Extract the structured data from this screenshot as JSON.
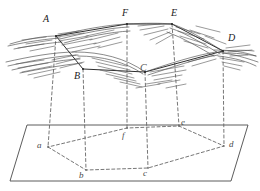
{
  "figure": {
    "type": "geometric-projection-diagram",
    "colors": {
      "stroke": "#3a3a3a",
      "hatch": "#555555",
      "dashed": "#666666",
      "plane": "#4a4a4a",
      "background": "#ffffff"
    },
    "upper_surface": {
      "name": "folded-surface",
      "points": [
        {
          "id": "A",
          "label": "A",
          "x": 56,
          "y": 36,
          "label_x": 43,
          "label_y": 14
        },
        {
          "id": "B",
          "label": "B",
          "x": 83,
          "y": 69,
          "label_x": 74,
          "label_y": 71
        },
        {
          "id": "C",
          "label": "C",
          "x": 145,
          "y": 72,
          "label_x": 140,
          "label_y": 63
        },
        {
          "id": "D",
          "label": "D",
          "x": 223,
          "y": 51,
          "label_x": 228,
          "label_y": 33
        },
        {
          "id": "E",
          "label": "E",
          "x": 172,
          "y": 24,
          "label_x": 171,
          "label_y": 8
        },
        {
          "id": "F",
          "label": "F",
          "x": 127,
          "y": 24,
          "label_x": 122,
          "label_y": 8
        }
      ]
    },
    "ground_plane": {
      "name": "horizontal-plane",
      "corners": [
        {
          "x": 27,
          "y": 125
        },
        {
          "x": 248,
          "y": 125
        },
        {
          "x": 231,
          "y": 181
        },
        {
          "x": 10,
          "y": 181
        }
      ],
      "points": [
        {
          "id": "a",
          "label": "a",
          "x": 48,
          "y": 147,
          "label_x": 40,
          "label_y": 142
        },
        {
          "id": "b",
          "label": "b",
          "x": 86,
          "y": 170,
          "label_x": 79,
          "label_y": 172
        },
        {
          "id": "c",
          "label": "c",
          "x": 148,
          "y": 168,
          "label_x": 143,
          "label_y": 170
        },
        {
          "id": "d",
          "label": "d",
          "x": 224,
          "y": 146,
          "label_x": 228,
          "label_y": 141
        },
        {
          "id": "e",
          "label": "e",
          "x": 179,
          "y": 126,
          "label_x": 181,
          "label_y": 120
        },
        {
          "id": "f",
          "label": "f",
          "x": 127,
          "y": 128,
          "label_x": 122,
          "label_y": 133
        }
      ],
      "polygon_order": [
        "a",
        "b",
        "c",
        "d",
        "e",
        "f"
      ]
    },
    "projection_lines": [
      {
        "from": "A",
        "to": "a"
      },
      {
        "from": "B",
        "to": "b"
      },
      {
        "from": "C",
        "to": "c"
      },
      {
        "from": "D",
        "to": "d"
      },
      {
        "from": "E",
        "to": "e"
      },
      {
        "from": "F",
        "to": "f"
      }
    ]
  }
}
